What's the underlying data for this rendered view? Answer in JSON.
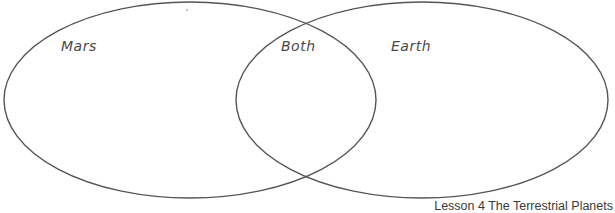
{
  "diagram": {
    "type": "venn",
    "sets": [
      {
        "label": "Mars",
        "cx": 190,
        "cy": 100,
        "rx": 186,
        "ry": 98
      },
      {
        "label": "Earth",
        "cx": 422,
        "cy": 100,
        "rx": 186,
        "ry": 98
      }
    ],
    "intersection_label": "Both",
    "stroke_color": "#555555",
    "label_color": "#4a4a4a"
  },
  "labels": {
    "left": "Mars",
    "middle": "Both",
    "right": "Earth"
  },
  "footer": {
    "text": "Lesson 4 The Terrestrial Planets"
  }
}
